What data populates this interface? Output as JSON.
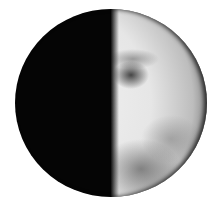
{
  "image": {
    "subject": "moon",
    "phase": "first quarter",
    "illuminated_side": "right",
    "colors": {
      "background": "#ffffff",
      "dark_side": "#050505",
      "lit_side": "#e6e6e6",
      "maria": "#3a3a3a"
    }
  }
}
